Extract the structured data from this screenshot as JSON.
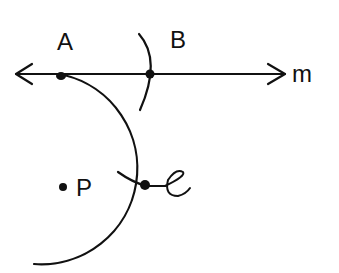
{
  "diagram": {
    "type": "geometric-construction",
    "line": {
      "label": "m",
      "stroke": "#111111"
    },
    "points": [
      {
        "id": "A",
        "label": "A",
        "x": 62,
        "y": 75
      },
      {
        "id": "B",
        "label": "B",
        "x": 150,
        "y": 74
      },
      {
        "id": "P",
        "label": "P",
        "x": 64,
        "y": 187
      },
      {
        "id": "C",
        "label": "C",
        "x": 146,
        "y": 186
      }
    ],
    "arcs": [
      {
        "name": "large-arc",
        "from": "A",
        "through": "C"
      },
      {
        "name": "arc-at-B",
        "through": "B"
      },
      {
        "name": "arc-at-C",
        "through": "C"
      }
    ],
    "colors": {
      "ink": "#111111",
      "background": "#ffffff"
    }
  }
}
